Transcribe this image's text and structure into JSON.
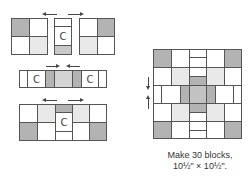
{
  "diagram": {
    "labels": {
      "unit_c": "C"
    },
    "caption": {
      "line1": "Make 30 blocks,",
      "line2": "10½\" × 10½\"."
    },
    "colors": {
      "white": "#ffffff",
      "light": "#e9e9e9",
      "medium": "#c9c9c9",
      "dark": "#b3b3b3",
      "outline": "#555555"
    }
  }
}
